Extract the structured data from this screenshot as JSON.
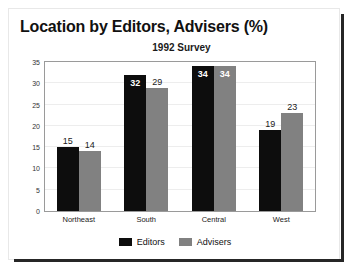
{
  "chart_data": {
    "type": "bar",
    "title": "Location by Editors, Advisers (%)",
    "subtitle": "1992 Survey",
    "xlabel": "",
    "ylabel": "",
    "ylim": [
      0,
      35
    ],
    "yticks": [
      0,
      5,
      10,
      15,
      20,
      25,
      30,
      35
    ],
    "grid": true,
    "legend_position": "bottom",
    "categories": [
      "Northeast",
      "South",
      "Central",
      "West"
    ],
    "series": [
      {
        "name": "Editors",
        "color": "#0d0d0d",
        "values": [
          15,
          32,
          34,
          19
        ]
      },
      {
        "name": "Advisers",
        "color": "#818181",
        "values": [
          14,
          29,
          34,
          23
        ]
      }
    ]
  }
}
